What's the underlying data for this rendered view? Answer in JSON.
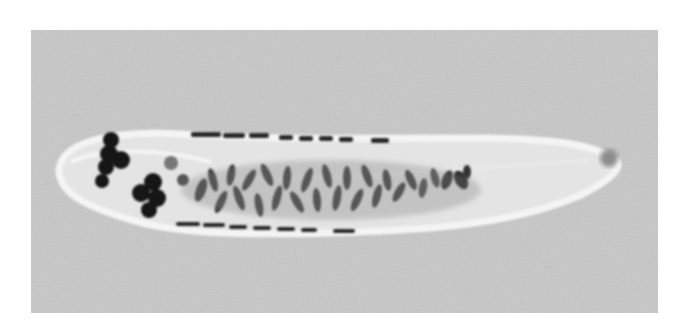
{
  "image": {
    "subject": "flatworm specimen micrograph",
    "colors": {
      "frame": "#ffffff",
      "background": "#c7c7c7",
      "body": "#e6e6e6",
      "body_edge": "#f2f2f2",
      "organs": "#1a1a1a",
      "glands": "#3a3a3a",
      "tail_spot": "#8a8a8a"
    }
  }
}
